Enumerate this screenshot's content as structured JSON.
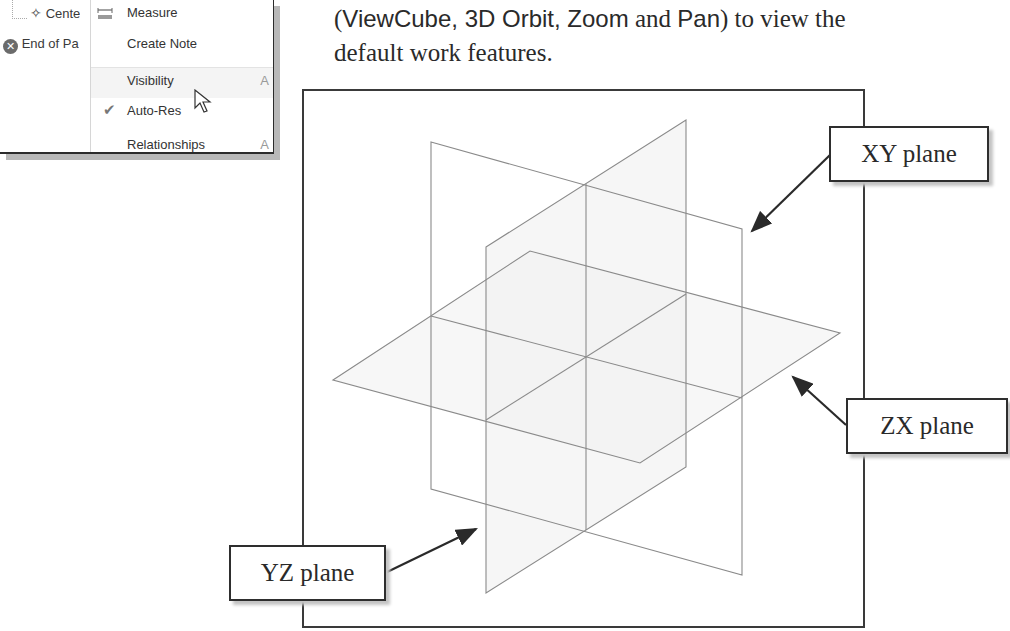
{
  "context_menu_screenshot": {
    "browser_tree": [
      {
        "label": "Cente",
        "icon": "center-point-icon"
      },
      {
        "label": "End of Pa",
        "icon": "end-of-part-icon"
      }
    ],
    "menu_items": [
      {
        "label": "Measure",
        "underline": "M",
        "icon": "measure-icon"
      },
      {
        "label": "Create Note",
        "underline": "C"
      },
      {
        "label": "Visibility",
        "underline": "V",
        "shortcut": "A",
        "highlighted": true
      },
      {
        "label": "Auto-Res",
        "underline": "A",
        "checked": true
      },
      {
        "label": "Relationships",
        "underline": "R",
        "shortcut": "A"
      }
    ]
  },
  "instruction": {
    "line1_parts": [
      "(",
      "ViewCube, 3D Orbit, Zoom",
      " and ",
      "Pan",
      ") to view the"
    ],
    "line2": "default work features."
  },
  "viewport": {
    "labels": {
      "xy": "XY plane",
      "zx": "ZX plane",
      "yz": "YZ plane"
    },
    "colors": {
      "plane_edge": "#8a8a8a",
      "plane_fill": "#f3f3f3",
      "arrow": "#2a2a2a",
      "border": "#3a3a3a"
    }
  }
}
